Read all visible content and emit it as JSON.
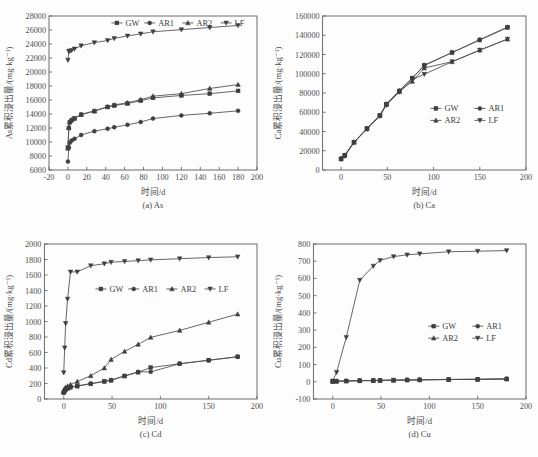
{
  "figure": {
    "axis_color": "#5c5c5c",
    "series_color": "#3f3f3f",
    "background": "#fdfdfd"
  },
  "panels": [
    {
      "id": "a",
      "caption": "(a) As",
      "xlabel": "时间/d",
      "ylabel": "As累积浸出量/(mg·kg⁻¹)",
      "legend_layout": "row",
      "legend_x": 0.3,
      "legend_y": 0.955
    },
    {
      "id": "b",
      "caption": "(b) Ca",
      "xlabel": "时间/d",
      "ylabel": "Ca累积浸出量/(mg·kg⁻¹)",
      "legend_layout": "grid",
      "legend_x": 0.53,
      "legend_y": 0.4
    },
    {
      "id": "c",
      "caption": "(c) Cd",
      "xlabel": "时间/d",
      "ylabel": "Cd累积浸出量/(mg·kg⁻¹)",
      "legend_layout": "row",
      "legend_x": 0.24,
      "legend_y": 0.71
    },
    {
      "id": "d",
      "caption": "(d) Cu",
      "xlabel": "时间/d",
      "ylabel": "Cu累积浸出量/(mg·kg⁻¹)",
      "legend_layout": "grid",
      "legend_x": 0.54,
      "legend_y": 0.47
    }
  ],
  "chart_data": [
    {
      "type": "line",
      "panel": "a",
      "title": "(a) As",
      "xlabel": "时间/d",
      "ylabel": "As累积浸出量/(mg·kg⁻¹)",
      "xlim": [
        -20,
        200
      ],
      "ylim": [
        6000,
        28000
      ],
      "xticks": [
        -20,
        0,
        20,
        40,
        60,
        80,
        100,
        120,
        140,
        160,
        180,
        200
      ],
      "yticks": [
        6000,
        8000,
        10000,
        12000,
        14000,
        16000,
        18000,
        20000,
        22000,
        24000,
        26000,
        28000
      ],
      "grid": false,
      "legend": [
        "GW",
        "AR1",
        "AR2",
        "LF"
      ],
      "legend_position": "upper-center",
      "series": [
        {
          "name": "GW",
          "marker": "square",
          "x": [
            0,
            1,
            2,
            4,
            7,
            14,
            28,
            42,
            49,
            63,
            77,
            90,
            120,
            150,
            180
          ],
          "values": [
            9200,
            12000,
            12800,
            13100,
            13350,
            13900,
            14400,
            15000,
            15200,
            15500,
            15900,
            16300,
            16650,
            16900,
            17300
          ]
        },
        {
          "name": "AR1",
          "marker": "circle",
          "x": [
            0,
            1,
            2,
            4,
            7,
            14,
            28,
            42,
            49,
            63,
            77,
            90,
            120,
            150,
            180
          ],
          "values": [
            7200,
            9200,
            9900,
            10200,
            10450,
            11000,
            11550,
            11900,
            12100,
            12450,
            12850,
            13350,
            13800,
            14100,
            14450
          ]
        },
        {
          "name": "AR2",
          "marker": "triangle-up",
          "x": [
            0,
            1,
            2,
            4,
            7,
            14,
            28,
            42,
            49,
            63,
            77,
            90,
            120,
            150,
            180
          ],
          "values": [
            9100,
            12100,
            12900,
            13200,
            13400,
            13950,
            14450,
            15050,
            15300,
            15600,
            16050,
            16550,
            16900,
            17650,
            18200
          ]
        },
        {
          "name": "LF",
          "marker": "triangle-down",
          "x": [
            0,
            1,
            2,
            4,
            7,
            14,
            28,
            42,
            49,
            63,
            77,
            90,
            120,
            150,
            180
          ],
          "values": [
            21700,
            22950,
            23000,
            23100,
            23300,
            23750,
            24200,
            24500,
            24800,
            25150,
            25450,
            25750,
            26050,
            26350,
            26650
          ]
        }
      ]
    },
    {
      "type": "line",
      "panel": "b",
      "title": "(b) Ca",
      "xlabel": "时间/d",
      "ylabel": "Ca累积浸出量/(mg·kg⁻¹)",
      "xlim": [
        -20,
        200
      ],
      "ylim": [
        0,
        160000
      ],
      "xticks": [
        0,
        50,
        100,
        150,
        200
      ],
      "yticks": [
        0,
        20000,
        40000,
        60000,
        80000,
        100000,
        120000,
        140000,
        160000
      ],
      "grid": false,
      "legend": [
        "GW",
        "AR1",
        "AR2",
        "LF"
      ],
      "legend_position": "center-right",
      "series": [
        {
          "name": "GW",
          "marker": "square",
          "x": [
            0,
            4,
            14,
            28,
            42,
            49,
            63,
            77,
            90,
            120,
            150,
            180
          ],
          "values": [
            11500,
            15000,
            29000,
            43000,
            56500,
            68500,
            82000,
            95500,
            108500,
            122000,
            135000,
            148000
          ]
        },
        {
          "name": "AR1",
          "marker": "circle",
          "x": [
            0,
            4,
            14,
            28,
            42,
            49,
            63,
            77,
            90,
            120,
            150,
            180
          ],
          "values": [
            12000,
            15500,
            29000,
            43000,
            57000,
            68500,
            82500,
            95500,
            109000,
            122000,
            135500,
            148500
          ]
        },
        {
          "name": "AR2",
          "marker": "triangle-up",
          "x": [
            0,
            4,
            14,
            28,
            42,
            49,
            63,
            77,
            90,
            120,
            150,
            180
          ],
          "values": [
            11800,
            15200,
            28800,
            42800,
            56500,
            68000,
            81500,
            92000,
            106000,
            112500,
            124500,
            136000
          ]
        },
        {
          "name": "LF",
          "marker": "triangle-down",
          "x": [
            0,
            4,
            14,
            28,
            42,
            49,
            63,
            77,
            90,
            120,
            150,
            180
          ],
          "values": [
            11000,
            14500,
            28500,
            42500,
            56000,
            67500,
            81000,
            94000,
            99500,
            112500,
            124500,
            136000
          ]
        }
      ]
    },
    {
      "type": "line",
      "panel": "c",
      "title": "(c) Cd",
      "xlabel": "时间/d",
      "ylabel": "Cd累积浸出量/(mg·kg⁻¹)",
      "xlim": [
        -20,
        200
      ],
      "ylim": [
        0,
        2000
      ],
      "xticks": [
        0,
        50,
        100,
        150,
        200
      ],
      "yticks": [
        0,
        200,
        400,
        600,
        800,
        1000,
        1200,
        1400,
        1600,
        1800,
        2000
      ],
      "grid": false,
      "legend": [
        "GW",
        "AR1",
        "AR2",
        "LF"
      ],
      "legend_position": "upper-center",
      "series": [
        {
          "name": "GW",
          "marker": "square",
          "x": [
            0,
            1,
            2,
            4,
            7,
            14,
            28,
            42,
            49,
            63,
            77,
            90,
            120,
            150,
            180
          ],
          "values": [
            80,
            105,
            120,
            135,
            150,
            165,
            195,
            225,
            240,
            295,
            345,
            405,
            455,
            500,
            545
          ]
        },
        {
          "name": "AR1",
          "marker": "circle",
          "x": [
            0,
            1,
            2,
            4,
            7,
            14,
            28,
            42,
            49,
            63,
            77,
            90,
            120,
            150,
            180
          ],
          "values": [
            85,
            110,
            125,
            140,
            155,
            170,
            200,
            230,
            245,
            300,
            350,
            350,
            455,
            500,
            545
          ]
        },
        {
          "name": "AR2",
          "marker": "triangle-up",
          "x": [
            0,
            1,
            2,
            4,
            7,
            14,
            28,
            42,
            49,
            63,
            77,
            90,
            120,
            150,
            180
          ],
          "values": [
            90,
            130,
            150,
            165,
            185,
            225,
            300,
            400,
            510,
            615,
            705,
            795,
            885,
            990,
            1095
          ]
        },
        {
          "name": "LF",
          "marker": "triangle-down",
          "x": [
            0,
            1,
            2,
            4,
            7,
            14,
            28,
            42,
            49,
            63,
            77,
            90,
            120,
            150,
            180
          ],
          "values": [
            340,
            660,
            975,
            1290,
            1640,
            1640,
            1720,
            1745,
            1765,
            1775,
            1785,
            1795,
            1810,
            1825,
            1835
          ]
        }
      ]
    },
    {
      "type": "line",
      "panel": "d",
      "title": "(d) Cu",
      "xlabel": "时间/d",
      "ylabel": "Cu累积浸出量/(mg·kg⁻¹)",
      "xlim": [
        -20,
        200
      ],
      "ylim": [
        -100,
        800
      ],
      "xticks": [
        0,
        50,
        100,
        150,
        200
      ],
      "yticks": [
        -100,
        0,
        100,
        200,
        300,
        400,
        500,
        600,
        700,
        800
      ],
      "grid": false,
      "legend": [
        "GW",
        "AR1",
        "AR2",
        "LF"
      ],
      "legend_position": "center-right",
      "series": [
        {
          "name": "GW",
          "marker": "square",
          "x": [
            0,
            4,
            14,
            28,
            42,
            49,
            63,
            77,
            90,
            120,
            150,
            180
          ],
          "values": [
            3,
            4,
            5,
            7,
            8,
            9,
            10,
            11,
            12,
            14,
            15,
            17
          ]
        },
        {
          "name": "AR1",
          "marker": "circle",
          "x": [
            0,
            4,
            14,
            28,
            42,
            49,
            63,
            77,
            90,
            120,
            150,
            180
          ],
          "values": [
            2,
            3,
            4,
            6,
            7,
            8,
            9,
            10,
            11,
            13,
            14,
            16
          ]
        },
        {
          "name": "AR2",
          "marker": "triangle-up",
          "x": [
            0,
            4,
            14,
            28,
            42,
            49,
            63,
            77,
            90,
            120,
            150,
            180
          ],
          "values": [
            2,
            3,
            4,
            6,
            7,
            8,
            9,
            10,
            11,
            13,
            14,
            16
          ]
        },
        {
          "name": "LF",
          "marker": "triangle-down",
          "x": [
            0,
            4,
            14,
            28,
            42,
            49,
            63,
            77,
            90,
            120,
            150,
            180
          ],
          "values": [
            5,
            55,
            258,
            590,
            672,
            705,
            727,
            737,
            743,
            755,
            758,
            762
          ]
        }
      ]
    }
  ]
}
